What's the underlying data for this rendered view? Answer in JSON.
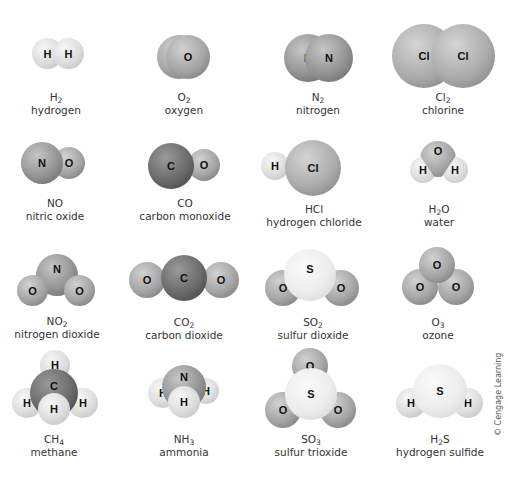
{
  "molecules": [
    {
      "formula_base": "H",
      "formula_sub": "2",
      "formula_tail": "",
      "name": "hydrogen"
    },
    {
      "formula_base": "O",
      "formula_sub": "2",
      "formula_tail": "",
      "name": "oxygen"
    },
    {
      "formula_base": "N",
      "formula_sub": "2",
      "formula_tail": "",
      "name": "nitrogen"
    },
    {
      "formula_base": "Cl",
      "formula_sub": "2",
      "formula_tail": "",
      "name": "chlorine"
    },
    {
      "formula_base": "NO",
      "formula_sub": "",
      "formula_tail": "",
      "name": "nitric oxide"
    },
    {
      "formula_base": "CO",
      "formula_sub": "",
      "formula_tail": "",
      "name": "carbon monoxide"
    },
    {
      "formula_base": "HCl",
      "formula_sub": "",
      "formula_tail": "",
      "name": "hydrogen chloride"
    },
    {
      "formula_base": "H",
      "formula_sub": "2",
      "formula_tail": "O",
      "name": "water"
    },
    {
      "formula_base": "NO",
      "formula_sub": "2",
      "formula_tail": "",
      "name": "nitrogen dioxide"
    },
    {
      "formula_base": "CO",
      "formula_sub": "2",
      "formula_tail": "",
      "name": "carbon dioxide"
    },
    {
      "formula_base": "SO",
      "formula_sub": "2",
      "formula_tail": "",
      "name": "sulfur dioxide"
    },
    {
      "formula_base": "O",
      "formula_sub": "3",
      "formula_tail": "",
      "name": "ozone"
    },
    {
      "formula_base": "CH",
      "formula_sub": "4",
      "formula_tail": "",
      "name": "methane"
    },
    {
      "formula_base": "NH",
      "formula_sub": "3",
      "formula_tail": "",
      "name": "ammonia"
    },
    {
      "formula_base": "SO",
      "formula_sub": "3",
      "formula_tail": "",
      "name": "sulfur trioxide"
    },
    {
      "formula_base": "H",
      "formula_sub": "2",
      "formula_tail": "S",
      "name": "hydrogen sulfide"
    }
  ],
  "atoms": {
    "H": "H",
    "O": "O",
    "N": "N",
    "C": "C",
    "Cl": "Cl",
    "S": "S"
  },
  "copyright": "© Cengage Learning"
}
